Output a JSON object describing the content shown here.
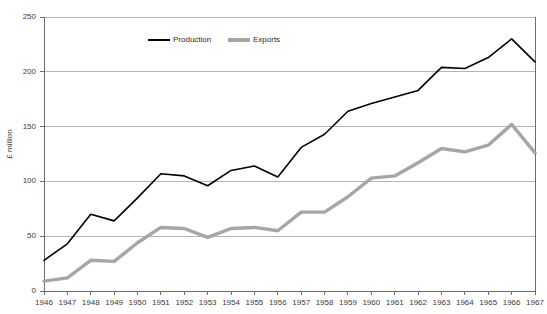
{
  "chart_data": {
    "type": "line",
    "title": "",
    "xlabel": "",
    "ylabel": "£ million",
    "ylim": [
      0,
      250
    ],
    "ytick_step": 50,
    "grid": true,
    "legend_position": "top-center-inside",
    "categories": [
      "1946",
      "1947",
      "1948",
      "1949",
      "1950",
      "1951",
      "1952",
      "1953",
      "1954",
      "1955",
      "1956",
      "1957",
      "1958",
      "1959",
      "1960",
      "1961",
      "1962",
      "1963",
      "1964",
      "1965",
      "1966",
      "1967"
    ],
    "ytick_labels": [
      "0",
      "50",
      "100",
      "150",
      "200",
      "250"
    ],
    "series": [
      {
        "name": "Production",
        "color": "#000000",
        "values": [
          28,
          43,
          70,
          64,
          85,
          107,
          105,
          96,
          110,
          114,
          104,
          131,
          143,
          164,
          171,
          177,
          183,
          204,
          203,
          213,
          230,
          209
        ]
      },
      {
        "name": "Exports",
        "color": "#a6a6a6",
        "values": [
          9,
          12,
          28,
          27,
          44,
          58,
          57,
          49,
          57,
          58,
          55,
          72,
          72,
          86,
          103,
          105,
          117,
          130,
          127,
          133,
          152,
          126
        ]
      }
    ]
  },
  "legend": {
    "items": [
      {
        "label": "Production",
        "color": "#000000"
      },
      {
        "label": "Exports",
        "color": "#a6a6a6"
      }
    ]
  },
  "axes": {
    "y_title": "£ million",
    "axis_color": "#6e6e6e",
    "grid_color": "#b5b5b5"
  }
}
